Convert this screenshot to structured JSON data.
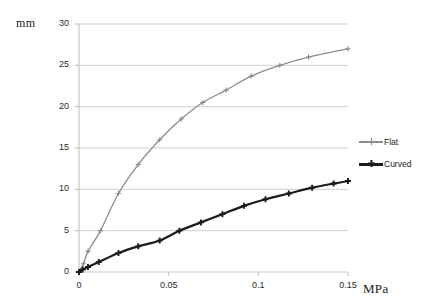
{
  "chart_data": {
    "type": "line",
    "title": "",
    "subtitle": "",
    "xlabel": "MPa",
    "ylabel": "mm",
    "xlim": [
      0,
      0.15
    ],
    "ylim": [
      0,
      30
    ],
    "grid": true,
    "grid_axis": "y",
    "legend_position": "right",
    "xticks": [
      0,
      0.05,
      0.1,
      0.15
    ],
    "xtick_labels": [
      "0",
      "0.05",
      "0.1",
      "0.15"
    ],
    "yticks": [
      0,
      5,
      10,
      15,
      20,
      25,
      30
    ],
    "ytick_labels": [
      "0",
      "5",
      "10",
      "15",
      "20",
      "25",
      "30"
    ],
    "series": [
      {
        "name": "Flat",
        "color": "#8c8c8c",
        "marker": "plus",
        "x": [
          0,
          0.0025,
          0.005,
          0.012,
          0.022,
          0.033,
          0.045,
          0.057,
          0.069,
          0.082,
          0.096,
          0.112,
          0.128,
          0.15
        ],
        "values": [
          0,
          1.0,
          2.5,
          5.0,
          9.5,
          13.0,
          16.0,
          18.5,
          20.5,
          22.0,
          23.7,
          25.0,
          26.0,
          27.0
        ]
      },
      {
        "name": "Curved",
        "color": "#1c1c1c",
        "marker": "plus",
        "x": [
          0,
          0.002,
          0.005,
          0.011,
          0.022,
          0.033,
          0.045,
          0.056,
          0.068,
          0.08,
          0.092,
          0.104,
          0.117,
          0.13,
          0.142,
          0.15
        ],
        "values": [
          0,
          0.3,
          0.6,
          1.2,
          2.3,
          3.1,
          3.8,
          5.0,
          6.0,
          7.0,
          8.0,
          8.8,
          9.5,
          10.2,
          10.7,
          11.0
        ]
      }
    ]
  },
  "axes": {
    "y_unit_label": "mm",
    "x_unit_label": "MPa"
  },
  "legend": {
    "items": [
      {
        "label": "Flat",
        "color": "#8c8c8c"
      },
      {
        "label": "Curved",
        "color": "#1c1c1c"
      }
    ]
  },
  "colors": {
    "flat": "#8c8c8c",
    "curved": "#1c1c1c",
    "grid": "#c9c9c9",
    "axis": "#bdbdbd",
    "text": "#2b2b2b",
    "background": "#ffffff"
  }
}
